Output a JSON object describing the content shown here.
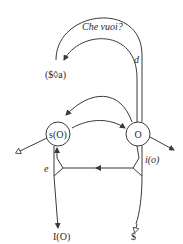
{
  "diagram": {
    "nodes": {
      "s_O": "s(O)",
      "O": "O"
    },
    "labels": {
      "che_vuoi": "Che vuoi?",
      "fantasy": "($◊a)",
      "desire": "d",
      "ego": "e",
      "ideal_ego": "i(o)",
      "ego_ideal": "I(O)",
      "subject": "$"
    },
    "colors": {
      "line": "#3a3a3a",
      "text": "#2a2a2a",
      "background": "#ffffff"
    }
  }
}
